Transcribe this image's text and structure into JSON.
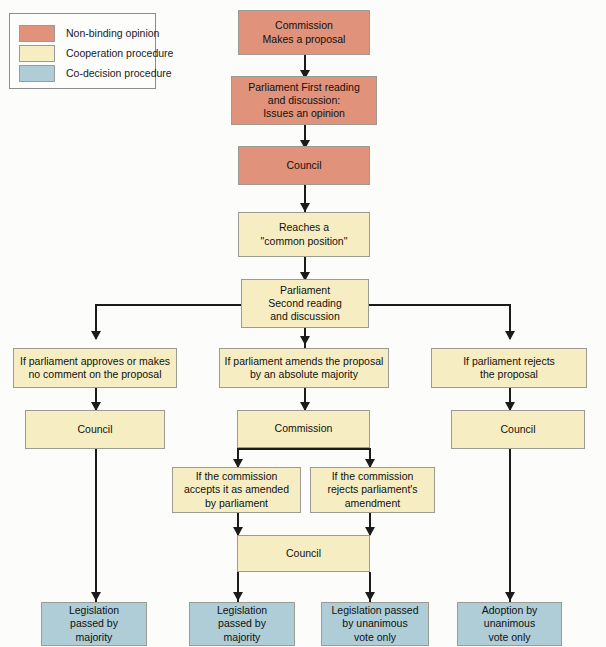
{
  "diagram": {
    "colors": {
      "non_binding": "#e0927a",
      "cooperation": "#f6eec2",
      "co_decision": "#aecdd6",
      "connector": "#1b1b1b",
      "background": "#fcfcfa"
    }
  },
  "legend": {
    "items": [
      {
        "label": "Non-binding opinion",
        "color": "#e0927a"
      },
      {
        "label": "Cooperation procedure",
        "color": "#f6eec2"
      },
      {
        "label": "Co-decision procedure",
        "color": "#aecdd6"
      }
    ]
  },
  "nodes": {
    "commission_proposal": "Commission\nMakes a proposal",
    "parliament_first_reading": "Parliament First reading\nand discussion:\nIssues an opinion",
    "council_1": "Council",
    "common_position": "Reaches a\n\"common position\"",
    "parliament_second_reading": "Parliament\nSecond reading\nand discussion",
    "branch_left": "If parliament approves or makes\nno comment on the proposal",
    "branch_middle": "If parliament amends the proposal\nby an absolute majority",
    "branch_right": "If parliament rejects\nthe proposal",
    "council_left": "Council",
    "commission_middle": "Commission",
    "council_right": "Council",
    "commission_accepts": "If the commission\naccepts it as amended\nby parliament",
    "commission_rejects": "If the commission\nrejects parliament's\namendment",
    "council_centre": "Council",
    "outcome_1": "Legislation\npassed by\nmajority",
    "outcome_2": "Legislation\npassed by\nmajority",
    "outcome_3": "Legislation passed\nby unanimous\nvote only",
    "outcome_4": "Adoption by\nunanimous\nvote only"
  }
}
